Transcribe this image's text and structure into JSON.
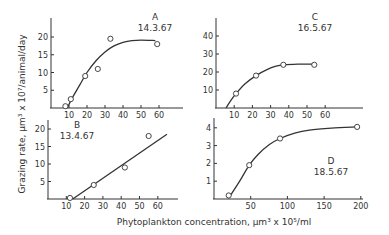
{
  "figure": {
    "ylabel": "Grazing rate, μm³ x 10⁷/animal/day",
    "xlabel": "Phytoplankton concentration, μm³ x 10⁵/ml",
    "colors": {
      "ink": "#333333",
      "background": "#ffffff"
    }
  },
  "chart_data": [
    {
      "panel": "A",
      "type": "scatter",
      "title": "A",
      "subtitle": "14.3.67",
      "xlabel": "Phytoplankton concentration, μm³ x 10⁵/ml",
      "ylabel": "Grazing rate, μm³ x 10⁷/animal/day",
      "xticks": [
        10,
        20,
        30,
        40,
        50,
        60
      ],
      "yticks": [
        5,
        10,
        15,
        20
      ],
      "xlim": [
        0,
        72
      ],
      "ylim": [
        0,
        25
      ],
      "points": [
        {
          "x": 8,
          "y": 0.5
        },
        {
          "x": 11,
          "y": 2.5
        },
        {
          "x": 19,
          "y": 9
        },
        {
          "x": 26,
          "y": 11
        },
        {
          "x": 33,
          "y": 19.5
        },
        {
          "x": 59,
          "y": 18
        }
      ],
      "fit_curve": [
        {
          "x": 9,
          "y": 0
        },
        {
          "x": 12,
          "y": 3
        },
        {
          "x": 16,
          "y": 6.5
        },
        {
          "x": 20,
          "y": 10
        },
        {
          "x": 25,
          "y": 13.3
        },
        {
          "x": 30,
          "y": 15.8
        },
        {
          "x": 35,
          "y": 17.5
        },
        {
          "x": 40,
          "y": 18.5
        },
        {
          "x": 45,
          "y": 19
        },
        {
          "x": 50,
          "y": 19.1
        },
        {
          "x": 58,
          "y": 19
        }
      ]
    },
    {
      "panel": "B",
      "type": "scatter",
      "title": "B",
      "subtitle": "13.4.67",
      "xticks": [
        10,
        20,
        30,
        40,
        50,
        60
      ],
      "yticks": [
        5,
        10,
        15,
        20
      ],
      "xlim": [
        0,
        72
      ],
      "ylim": [
        0,
        25
      ],
      "points": [
        {
          "x": 12,
          "y": 0.3
        },
        {
          "x": 25,
          "y": 4
        },
        {
          "x": 42,
          "y": 9
        },
        {
          "x": 55,
          "y": 18
        }
      ],
      "fit_curve": [
        {
          "x": 13.5,
          "y": 0
        },
        {
          "x": 65,
          "y": 18.5
        }
      ]
    },
    {
      "panel": "C",
      "type": "scatter",
      "title": "C",
      "subtitle": "16.5.67",
      "xticks": [
        10,
        20,
        30,
        40,
        50,
        60
      ],
      "yticks": [
        10,
        20,
        30,
        40
      ],
      "xlim": [
        0,
        80
      ],
      "ylim": [
        0,
        50
      ],
      "points": [
        {
          "x": 11,
          "y": 8
        },
        {
          "x": 22,
          "y": 18
        },
        {
          "x": 37,
          "y": 24
        },
        {
          "x": 54,
          "y": 24
        }
      ],
      "fit_curve": [
        {
          "x": 5.5,
          "y": 0
        },
        {
          "x": 8,
          "y": 4
        },
        {
          "x": 11,
          "y": 8
        },
        {
          "x": 16,
          "y": 13.5
        },
        {
          "x": 22,
          "y": 18
        },
        {
          "x": 28,
          "y": 21.3
        },
        {
          "x": 33,
          "y": 23.2
        },
        {
          "x": 37,
          "y": 24
        },
        {
          "x": 45,
          "y": 24.4
        },
        {
          "x": 54,
          "y": 24.4
        }
      ]
    },
    {
      "panel": "D",
      "type": "scatter",
      "title": "D",
      "subtitle": "18.5.67",
      "xticks": [
        50,
        100,
        150,
        200
      ],
      "yticks": [
        1,
        2,
        3,
        4
      ],
      "xlim": [
        0,
        203
      ],
      "ylim": [
        0,
        5
      ],
      "points": [
        {
          "x": 20,
          "y": 0.2
        },
        {
          "x": 48,
          "y": 1.9
        },
        {
          "x": 90,
          "y": 3.4
        },
        {
          "x": 195,
          "y": 4.05
        }
      ],
      "fit_curve": [
        {
          "x": 20,
          "y": 0.05
        },
        {
          "x": 35,
          "y": 1.0
        },
        {
          "x": 48,
          "y": 1.9
        },
        {
          "x": 60,
          "y": 2.5
        },
        {
          "x": 75,
          "y": 3.05
        },
        {
          "x": 90,
          "y": 3.4
        },
        {
          "x": 110,
          "y": 3.7
        },
        {
          "x": 130,
          "y": 3.87
        },
        {
          "x": 160,
          "y": 3.98
        },
        {
          "x": 195,
          "y": 4.05
        }
      ]
    }
  ]
}
